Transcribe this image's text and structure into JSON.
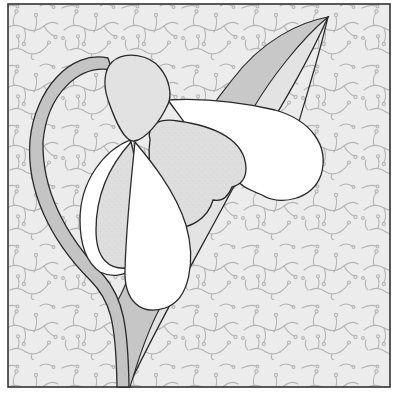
{
  "illustration": {
    "subject": "Snowdrop flower appliqué block",
    "colors": {
      "background_fabric": "#ececec",
      "vine_print": "#b4b4b4",
      "border": "#333333",
      "outline": "#2a2a2a",
      "stem": "#c4c4c4",
      "leaf_dark": "#c8c8c8",
      "leaf_light": "#e8e8e8",
      "cap": "#e2e2e2",
      "petal_white": "#ffffff",
      "inner_petal_speckled": "#dedede",
      "frame_white": "#ffffff"
    },
    "parts": [
      "stem",
      "leaf",
      "flower-cap",
      "outer-petal-right",
      "inner-petal-speckled",
      "outer-petal-left",
      "center-petal",
      "background-vine-print"
    ]
  }
}
